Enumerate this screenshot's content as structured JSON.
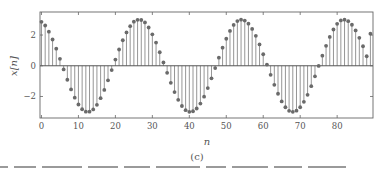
{
  "chart_data": {
    "type": "stem",
    "title": "",
    "xlabel": "n",
    "ylabel": "x[n]",
    "caption": "(c)",
    "xlim": [
      -0.4,
      89.7
    ],
    "ylim": [
      -3.4,
      3.5
    ],
    "xticks": [
      0,
      10,
      20,
      30,
      40,
      50,
      60,
      70,
      80
    ],
    "yticks": [
      -2,
      0,
      2
    ],
    "grid": false,
    "legend": null,
    "series": [
      {
        "name": "x[n]",
        "model": "3*cos(2*pi*n/31.5 + 0.30)",
        "x": [
          0,
          1,
          2,
          3,
          4,
          5,
          6,
          7,
          8,
          9,
          10,
          11,
          12,
          13,
          14,
          15,
          16,
          17,
          18,
          19,
          20,
          21,
          22,
          23,
          24,
          25,
          26,
          27,
          28,
          29,
          30,
          31,
          32,
          33,
          34,
          35,
          36,
          37,
          38,
          39,
          40,
          41,
          42,
          43,
          44,
          45,
          46,
          47,
          48,
          49,
          50,
          51,
          52,
          53,
          54,
          55,
          56,
          57,
          58,
          59,
          60,
          61,
          62,
          63,
          64,
          65,
          66,
          67,
          68,
          69,
          70,
          71,
          72,
          73,
          74,
          75,
          76,
          77,
          78,
          79,
          80,
          81,
          82,
          83,
          84,
          85,
          86,
          87,
          88,
          89
        ],
        "values": [
          2.86,
          2.62,
          2.22,
          1.71,
          1.11,
          0.45,
          -0.24,
          -0.91,
          -1.54,
          -2.08,
          -2.52,
          -2.83,
          -2.99,
          -2.99,
          -2.84,
          -2.54,
          -2.11,
          -1.57,
          -0.95,
          -0.28,
          0.4,
          1.06,
          1.66,
          2.17,
          2.58,
          2.87,
          2.99,
          2.98,
          2.82,
          2.49,
          2.05,
          1.51,
          0.88,
          0.22,
          -0.46,
          -1.11,
          -1.71,
          -2.22,
          -2.62,
          -2.89,
          -3.0,
          -2.96,
          -2.78,
          -2.46,
          -2.01,
          -1.45,
          -0.82,
          -0.15,
          0.53,
          1.18,
          1.76,
          2.27,
          2.66,
          2.91,
          3.0,
          2.94,
          2.74,
          2.4,
          1.95,
          1.39,
          0.75,
          0.08,
          -0.59,
          -1.24,
          -1.82,
          -2.32,
          -2.7,
          -2.93,
          -3.0,
          -2.92,
          -2.7,
          -2.35,
          -1.89,
          -1.33,
          -0.69,
          -0.01,
          0.66,
          1.3,
          1.88,
          2.36,
          2.73,
          2.95,
          3.0,
          2.9,
          2.67,
          2.3,
          1.82,
          1.27,
          0.62,
          2.09
        ]
      }
    ],
    "colors": {
      "stem": "#8a8a8a",
      "marker": "#6a6a6a",
      "axes": "#666666",
      "baseline": "#555555"
    }
  }
}
